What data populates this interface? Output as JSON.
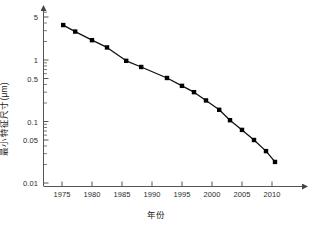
{
  "chart_data": {
    "type": "line",
    "title": "",
    "xlabel": "年份",
    "ylabel": "最小特征尺寸(μm)",
    "yscale": "log",
    "ylim": [
      0.01,
      7
    ],
    "xlim": [
      1972,
      2016
    ],
    "grid": false,
    "legend": "none",
    "marker": "square",
    "line_color": "#111111",
    "marker_color": "#000000",
    "axis_color": "#555555",
    "y_ticks": [
      {
        "value": 5,
        "label": "5"
      },
      {
        "value": 1,
        "label": "1"
      },
      {
        "value": 0.5,
        "label": "0.5"
      },
      {
        "value": 0.1,
        "label": "0.1"
      },
      {
        "value": 0.05,
        "label": "0.05"
      },
      {
        "value": 0.01,
        "label": "0.01"
      }
    ],
    "y_minor_ticks": [
      6,
      4,
      3,
      2,
      0.9,
      0.8,
      0.7,
      0.6,
      0.4,
      0.3,
      0.2,
      0.09,
      0.08,
      0.07,
      0.06,
      0.04,
      0.03,
      0.02
    ],
    "x_ticks": [
      {
        "value": 1975,
        "label": "1975"
      },
      {
        "value": 1980,
        "label": "1980"
      },
      {
        "value": 1985,
        "label": "1985"
      },
      {
        "value": 1990,
        "label": "1990"
      },
      {
        "value": 1995,
        "label": "1995"
      },
      {
        "value": 2000,
        "label": "2000"
      },
      {
        "value": 2005,
        "label": "2005"
      },
      {
        "value": 2010,
        "label": "2010"
      }
    ],
    "series": [
      {
        "name": "最小特征尺寸",
        "x": [
          1975.2,
          1977.2,
          1980.0,
          1982.5,
          1985.7,
          1988.2,
          1992.5,
          1995.0,
          1997.0,
          1999.0,
          2001.2,
          2003.0,
          2005.0,
          2007.0,
          2009.0,
          2010.5
        ],
        "values": [
          3.7,
          2.9,
          2.1,
          1.6,
          0.97,
          0.77,
          0.51,
          0.38,
          0.3,
          0.22,
          0.155,
          0.105,
          0.073,
          0.05,
          0.033,
          0.022
        ]
      }
    ]
  }
}
